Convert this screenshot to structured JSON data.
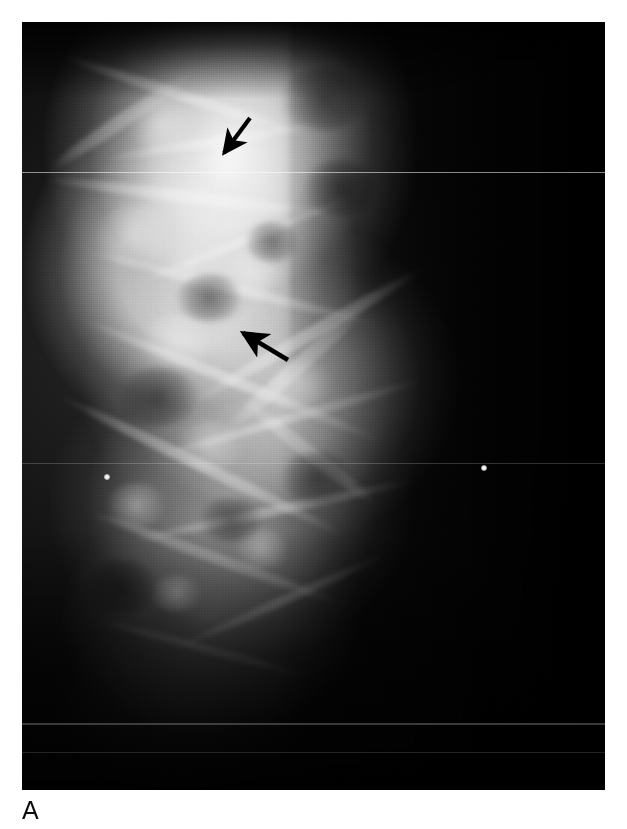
{
  "figure": {
    "panel_letter": "A",
    "modality": "mammogram",
    "view": "radiographic-film-panel",
    "background_color": "#ffffff",
    "film_color": "#050505"
  },
  "radiograph": {
    "x": 22,
    "y": 22,
    "width": 583,
    "height": 768,
    "tissue_highlight_color": "#ffffff",
    "tissue_shadow_color": "#000000"
  },
  "annotations": {
    "arrow_color": "#000000",
    "arrows": [
      {
        "name": "upper-arrow",
        "direction": "down-left",
        "tail_x": 250,
        "tail_y": 118,
        "tip_x": 222,
        "tip_y": 154
      },
      {
        "name": "lower-arrow",
        "direction": "up-left",
        "tail_x": 288,
        "tail_y": 360,
        "tip_x": 241,
        "tip_y": 331
      }
    ],
    "specks": [
      {
        "name": "calcification-left",
        "x": 107,
        "y": 477,
        "size": 6
      },
      {
        "name": "calcification-right",
        "x": 484,
        "y": 468,
        "size": 6
      }
    ]
  },
  "artifacts": {
    "scanlines": [
      {
        "y": 172,
        "opacity": 0.55,
        "height": 1
      },
      {
        "y": 463,
        "opacity": 0.18,
        "height": 1
      },
      {
        "y": 723,
        "opacity": 0.22,
        "height": 2
      },
      {
        "y": 752,
        "opacity": 0.14,
        "height": 1
      }
    ]
  }
}
